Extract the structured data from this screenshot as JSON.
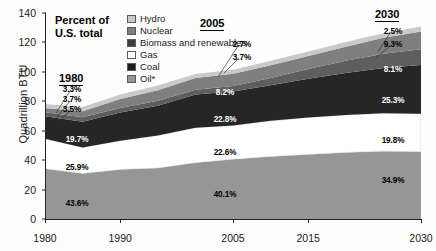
{
  "chart_data": {
    "type": "area",
    "title": "Percent of U.S. total",
    "xlabel": "",
    "ylabel": "Quadrillion BTU",
    "ylim": [
      0,
      140
    ],
    "ytick_labels": [
      "0",
      "20",
      "40",
      "60",
      "80",
      "100",
      "120",
      "140"
    ],
    "xtick_labels": [
      "1980",
      "1990",
      "2005",
      "2015",
      "2030"
    ],
    "xlim": [
      1980,
      2030
    ],
    "grid": false,
    "legend_position": "top-center",
    "stack_order_bottom_to_top": [
      "Oil*",
      "Gas",
      "Coal",
      "Biomass and renewables",
      "Nuclear",
      "Hydro"
    ],
    "series": [
      {
        "name": "Oil*",
        "color": "#969696",
        "x": [
          1980,
          1985,
          1990,
          1995,
          2000,
          2005,
          2010,
          2015,
          2020,
          2025,
          2030
        ],
        "values": [
          34.2,
          30.9,
          33.6,
          34.6,
          38.2,
          40.6,
          42.4,
          43.9,
          45.2,
          46.1,
          45.7
        ]
      },
      {
        "name": "Gas",
        "color": "#ffffff",
        "x": [
          1980,
          1985,
          1990,
          1995,
          2000,
          2005,
          2010,
          2015,
          2020,
          2025,
          2030
        ],
        "values": [
          20.3,
          17.7,
          19.6,
          22.2,
          23.8,
          22.9,
          24.3,
          25.0,
          25.5,
          25.8,
          25.9
        ]
      },
      {
        "name": "Coal",
        "color": "#262626",
        "x": [
          1980,
          1985,
          1990,
          1995,
          2000,
          2005,
          2010,
          2015,
          2020,
          2025,
          2030
        ],
        "values": [
          15.4,
          17.5,
          19.2,
          20.1,
          22.6,
          23.1,
          24.2,
          26.4,
          28.6,
          30.8,
          33.1
        ]
      },
      {
        "name": "Biomass and renewables",
        "color": "#5e5e5e",
        "x": [
          1980,
          1985,
          1990,
          1995,
          2000,
          2005,
          2010,
          2015,
          2020,
          2025,
          2030
        ],
        "values": [
          2.7,
          3.0,
          3.1,
          3.4,
          3.3,
          3.8,
          5.0,
          6.6,
          8.2,
          9.6,
          10.6
        ]
      },
      {
        "name": "Nuclear",
        "color": "#7f7f7f",
        "x": [
          1980,
          1985,
          1990,
          1995,
          2000,
          2005,
          2010,
          2015,
          2020,
          2025,
          2030
        ],
        "values": [
          2.9,
          4.1,
          6.1,
          7.2,
          7.9,
          8.3,
          8.6,
          8.9,
          9.6,
          10.8,
          12.2
        ]
      },
      {
        "name": "Hydro",
        "color": "#c9c9c9",
        "x": [
          1980,
          1985,
          1990,
          1995,
          2000,
          2005,
          2010,
          2015,
          2020,
          2025,
          2030
        ],
        "values": [
          2.6,
          2.9,
          3.0,
          3.2,
          2.8,
          2.7,
          3.0,
          3.1,
          3.2,
          3.2,
          3.3
        ]
      }
    ],
    "annotation_columns": [
      {
        "year": "1980",
        "labels": [
          {
            "series": "Hydro",
            "value": "3.3%"
          },
          {
            "series": "Nuclear",
            "value": "3.7%"
          },
          {
            "series": "Biomass and renewables",
            "value": "3.5%"
          },
          {
            "series": "Coal",
            "value": "19.7%"
          },
          {
            "series": "Gas",
            "value": "25.9%"
          },
          {
            "series": "Oil*",
            "value": "43.6%"
          }
        ]
      },
      {
        "year": "2005",
        "labels": [
          {
            "series": "Biomass and renewables",
            "value": "2.7%"
          },
          {
            "series": "Nuclear_upper",
            "value": "3.7%"
          },
          {
            "series": "Nuclear",
            "value": "8.2%"
          },
          {
            "series": "Coal",
            "value": "22.8%"
          },
          {
            "series": "Gas",
            "value": "22.6%"
          },
          {
            "series": "Oil*",
            "value": "40.1%"
          }
        ]
      },
      {
        "year": "2030",
        "labels": [
          {
            "series": "Hydro",
            "value": "2.5%"
          },
          {
            "series": "Nuclear",
            "value": "9.3%"
          },
          {
            "series": "Biomass and renewables",
            "value": "8.1%"
          },
          {
            "series": "Coal",
            "value": "25.3%"
          },
          {
            "series": "Gas",
            "value": "19.8%"
          },
          {
            "series": "Oil*",
            "value": "34.9%"
          }
        ]
      }
    ]
  },
  "headline": {
    "line1": "Percent of",
    "line2": "U.S. total"
  },
  "legend": {
    "items": [
      {
        "label": "Hydro",
        "color": "#c9c9c9"
      },
      {
        "label": "Nuclear",
        "color": "#7f7f7f"
      },
      {
        "label": "Biomass and renewables",
        "color": "#3d3d3d"
      },
      {
        "label": "Gas",
        "color": "#ffffff"
      },
      {
        "label": "Coal",
        "color": "#1c1c1c"
      },
      {
        "label": "Oil*",
        "color": "#969696"
      }
    ]
  },
  "axis": {
    "y_title": "Quadrillion BTU",
    "y_ticks": [
      "140",
      "120",
      "100",
      "80",
      "60",
      "40",
      "20",
      "0"
    ],
    "x_ticks": [
      "1980",
      "1990",
      "2005",
      "2015",
      "2030"
    ]
  },
  "year_headers": {
    "y1980": "1980",
    "y2005": "2005",
    "y2030": "2030"
  },
  "values_1980": {
    "hydro": "3.3%",
    "nuclear": "3.7%",
    "biomass": "3.5%",
    "coal": "19.7%",
    "gas": "25.9%",
    "oil": "43.6%"
  },
  "values_2005": {
    "biomass": "2.7%",
    "hydro": "3.7%",
    "nuclear": "8.2%",
    "coal": "22.8%",
    "gas": "22.6%",
    "oil": "40.1%"
  },
  "values_2030": {
    "hydro": "2.5%",
    "nuclear": "9.3%",
    "biomass": "8.1%",
    "coal": "25.3%",
    "gas": "19.8%",
    "oil": "34.9%"
  }
}
